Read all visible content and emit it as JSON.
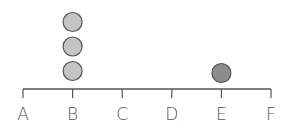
{
  "chart_data": {
    "type": "dot-plot",
    "title": "",
    "xlabel": "",
    "ylabel": "",
    "categories": [
      "A",
      "B",
      "C",
      "D",
      "E",
      "F"
    ],
    "values": [
      0,
      3,
      0,
      0,
      1,
      0
    ],
    "grid": false,
    "legend": null,
    "dot_colors": {
      "B": "#c4c4c4",
      "E": "#8c8c8c"
    },
    "axis_color": "#555555",
    "dot_stroke": "#555555"
  }
}
